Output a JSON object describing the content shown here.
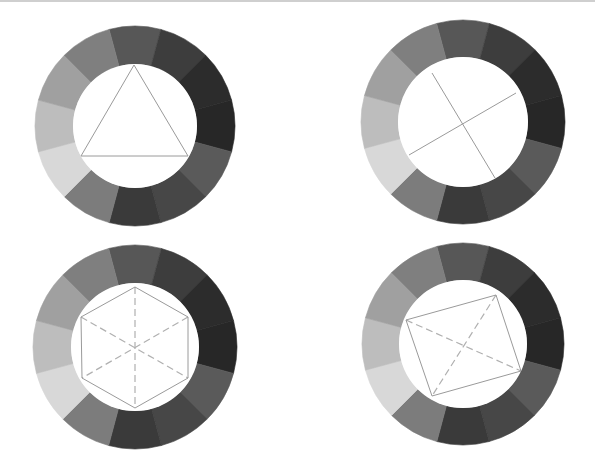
{
  "figure": {
    "segment_angles_deg": [
      0,
      30,
      60,
      90,
      120,
      150,
      180,
      210,
      240,
      270,
      300,
      330
    ],
    "segment_colors": [
      "#575757",
      "#3d3d3d",
      "#2c2c2c",
      "#272727",
      "#5a5a5a",
      "#474747",
      "#3a3a3a",
      "#7c7c7c",
      "#d8d8d8",
      "#bdbdbd",
      "#a0a0a0",
      "#7f7f7f"
    ],
    "solid_line_color": "#9a9a9a",
    "dashed_line_color": "#b0b0b0"
  },
  "wheels": [
    {
      "name": "triad-wheel",
      "center": [
        135,
        126
      ],
      "outer_r": 100,
      "inner_r": 62,
      "overlay": "triangle",
      "solid_polygon": [
        [
          134,
          65
        ],
        [
          188,
          156
        ],
        [
          81,
          156
        ]
      ],
      "dashed_lines": []
    },
    {
      "name": "complementary-pairs-wheel",
      "center": [
        463,
        122
      ],
      "outer_r": 102,
      "inner_r": 65,
      "overlay": "cross",
      "solid_lines": [
        [
          [
            432,
            73
          ],
          [
            495,
            178
          ]
        ],
        [
          [
            409,
            155
          ],
          [
            516,
            93
          ]
        ]
      ],
      "dashed_lines": []
    },
    {
      "name": "hexad-wheel",
      "center": [
        135,
        347
      ],
      "outer_r": 102,
      "inner_r": 64,
      "overlay": "hexagon",
      "solid_polygon": [
        [
          135,
          287
        ],
        [
          188,
          317
        ],
        [
          188,
          378
        ],
        [
          135,
          408
        ],
        [
          82,
          378
        ],
        [
          81,
          317
        ]
      ],
      "dashed_lines": [
        [
          [
            135,
            287
          ],
          [
            135,
            408
          ]
        ],
        [
          [
            188,
            317
          ],
          [
            82,
            378
          ]
        ],
        [
          [
            81,
            317
          ],
          [
            188,
            378
          ]
        ]
      ]
    },
    {
      "name": "tetrad-wheel",
      "center": [
        463,
        344
      ],
      "outer_r": 101,
      "inner_r": 64,
      "overlay": "rectangle",
      "solid_polygon": [
        [
          406,
          320
        ],
        [
          496,
          295
        ],
        [
          521,
          371
        ],
        [
          432,
          396
        ]
      ],
      "dashed_lines": [
        [
          [
            406,
            320
          ],
          [
            521,
            371
          ]
        ],
        [
          [
            496,
            295
          ],
          [
            432,
            396
          ]
        ]
      ]
    }
  ]
}
